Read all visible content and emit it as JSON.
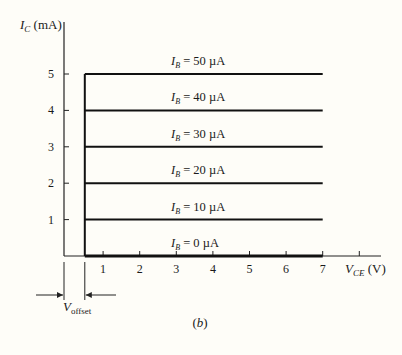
{
  "chart_data": {
    "type": "line",
    "title": "",
    "caption": "(b)",
    "xlabel": {
      "symbol": "V",
      "subscript": "CE",
      "unit": "(V)"
    },
    "ylabel": {
      "symbol": "I",
      "subscript": "C",
      "unit": "(mA)"
    },
    "xlim": [
      0,
      8
    ],
    "ylim": [
      0,
      5
    ],
    "x_ticks": [
      1,
      2,
      3,
      4,
      5,
      6,
      7,
      8
    ],
    "x_tick_labels": [
      "1",
      "2",
      "3",
      "4",
      "5",
      "6",
      "7",
      ""
    ],
    "y_ticks": [
      1,
      2,
      3,
      4,
      5
    ],
    "y_tick_labels": [
      "1",
      "2",
      "3",
      "4",
      "5"
    ],
    "grid": false,
    "legend": "none",
    "offset_voltage": 0.5,
    "offset_label": {
      "symbol": "V",
      "subscript": "offset"
    },
    "series": [
      {
        "name": "I_B = 0 µA",
        "label_value": "0",
        "ic": 0,
        "x": [
          0.5,
          7
        ]
      },
      {
        "name": "I_B = 10 µA",
        "label_value": "10",
        "ic": 1,
        "x": [
          0.5,
          7
        ]
      },
      {
        "name": "I_B = 20 µA",
        "label_value": "20",
        "ic": 2,
        "x": [
          0.5,
          7
        ]
      },
      {
        "name": "I_B = 30 µA",
        "label_value": "30",
        "ic": 3,
        "x": [
          0.5,
          7
        ]
      },
      {
        "name": "I_B = 40 µA",
        "label_value": "40",
        "ic": 4,
        "x": [
          0.5,
          7
        ]
      },
      {
        "name": "I_B = 50 µA",
        "label_value": "50",
        "ic": 5,
        "x": [
          0.5,
          7
        ]
      }
    ],
    "series_label": {
      "symbol": "I",
      "subscript": "B",
      "equals": "=",
      "unit": "µA"
    },
    "vertical_segment": {
      "x": 0.5,
      "y": [
        0,
        5
      ]
    }
  }
}
